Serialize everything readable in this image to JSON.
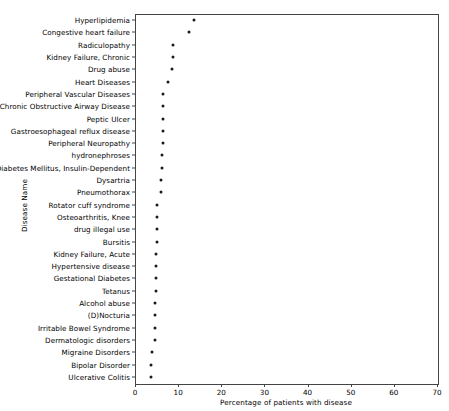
{
  "chart_data": {
    "type": "scatter",
    "title": "",
    "xlabel": "Percentage of patients with disease",
    "ylabel": "Disease Name",
    "xlim": [
      0,
      70
    ],
    "xticks": [
      0,
      10,
      20,
      30,
      40,
      50,
      60,
      70
    ],
    "xticklabels": [
      "0",
      "10",
      "20",
      "30",
      "40",
      "50",
      "60",
      "70"
    ],
    "grid": false,
    "legend": null,
    "marker": "dot",
    "marker_color": "#1a1a1a",
    "categories": [
      "Hyperlipidemia",
      "Congestive heart failure",
      "Radiculopathy",
      "Kidney Failure, Chronic",
      "Drug abuse",
      "Heart Diseases",
      "Peripheral Vascular Diseases",
      "Chronic Obstructive Airway Disease",
      "Peptic Ulcer",
      "Gastroesophageal reflux disease",
      "Peripheral Neuropathy",
      "hydronephroses",
      "Diabetes Mellitus, Insulin-Dependent",
      "Dysartria",
      "Pneumothorax",
      "Rotator cuff syndrome",
      "Osteoarthritis, Knee",
      "drug illegal use",
      "Bursitis",
      "Kidney Failure, Acute",
      "Hypertensive disease",
      "Gestational Diabetes",
      "Tetanus",
      "Alcohol abuse",
      "(D)Nocturia",
      "Irritable Bowel Syndrome",
      "Dermatologic disorders",
      "Migraine Disorders",
      "Bipolar Disorder",
      "Ulcerative Colitis"
    ],
    "values": [
      13.7,
      12.5,
      8.8,
      8.7,
      8.6,
      7.7,
      6.6,
      6.6,
      6.5,
      6.5,
      6.4,
      6.3,
      6.2,
      6.1,
      6.0,
      5.2,
      5.2,
      5.1,
      5.1,
      4.9,
      4.9,
      4.8,
      4.8,
      4.7,
      4.7,
      4.6,
      4.6,
      3.9,
      3.8,
      3.7
    ]
  }
}
